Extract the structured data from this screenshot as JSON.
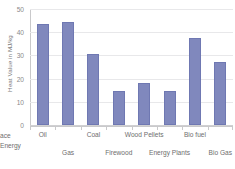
{
  "chart_data": {
    "type": "bar",
    "title": "",
    "xlabel": "",
    "ylabel": "Heat Value in MJ/kg",
    "ylim": [
      0,
      50
    ],
    "yticks": [
      0,
      10,
      20,
      30,
      40,
      50
    ],
    "ytick_labels": [
      "0",
      "10",
      "20",
      "30",
      "40",
      "50"
    ],
    "grid": true,
    "legend": "none",
    "bar_color": "#8088bd",
    "bar_edge_color": "#6f78b2",
    "grid_color": "#e8e8ea",
    "axis_color": "#c9c9cb",
    "text_color": "#6e6e6e",
    "categories": [
      "Oil",
      "Gas",
      "Coal",
      "Firewood",
      "Wood Pellets",
      "Energy Plants",
      "Bio fuel",
      "Bio Gas"
    ],
    "values": [
      43.5,
      44.5,
      30.5,
      14.5,
      18,
      14.5,
      37.5,
      27
    ],
    "category_rows": [
      1,
      2,
      1,
      2,
      1,
      2,
      1,
      2
    ]
  },
  "labels": {
    "left_caption_line1": "ace",
    "left_caption_line2": "Energy"
  }
}
